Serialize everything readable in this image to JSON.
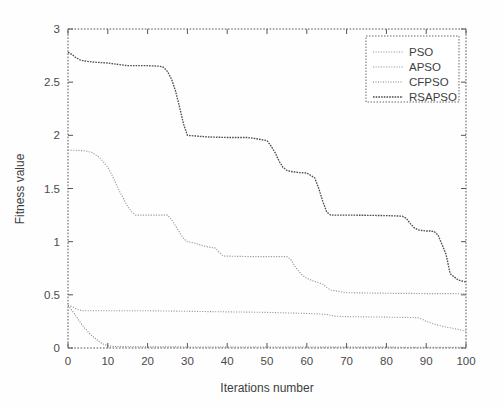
{
  "figure": {
    "background_color": "#fefefe",
    "axis_color": "#555555"
  },
  "chart_data": {
    "type": "line",
    "title": "",
    "subtitle": "",
    "xlabel": "Iterations number",
    "ylabel": "Fitness value",
    "xlim": [
      0,
      100
    ],
    "ylim": [
      0,
      3
    ],
    "xticks": [
      0,
      10,
      20,
      30,
      40,
      50,
      60,
      70,
      80,
      90,
      100
    ],
    "xticklabels": [
      "0",
      "10",
      "20",
      "30",
      "40",
      "50",
      "60",
      "70",
      "80",
      "90",
      "100"
    ],
    "yticks": [
      0,
      0.5,
      1,
      1.5,
      2,
      2.5,
      3
    ],
    "yticklabels": [
      "0",
      "0.5",
      "1",
      "1.5",
      "2",
      "2.5",
      "3"
    ],
    "grid": false,
    "legend_position": "upper right",
    "legend_entries": [
      "PSO",
      "APSO",
      "CFPSO",
      "RSAPSO"
    ],
    "series": [
      {
        "name": "PSO",
        "color": "#8d8d8d",
        "linestyle": "dotted",
        "x": [
          0,
          1,
          2,
          3,
          4,
          6,
          10,
          20,
          30,
          40,
          50,
          55,
          60,
          63,
          65,
          67,
          70,
          80,
          85,
          88,
          89,
          90,
          92,
          94,
          96,
          98,
          100
        ],
        "values": [
          0.4,
          0.39,
          0.37,
          0.355,
          0.35,
          0.35,
          0.35,
          0.35,
          0.345,
          0.34,
          0.335,
          0.33,
          0.325,
          0.32,
          0.315,
          0.3,
          0.295,
          0.29,
          0.288,
          0.285,
          0.27,
          0.25,
          0.225,
          0.205,
          0.19,
          0.175,
          0.16
        ]
      },
      {
        "name": "APSO",
        "color": "#9a9a9a",
        "linestyle": "dotted",
        "x": [
          0,
          2,
          4,
          6,
          8,
          10,
          11,
          12,
          13,
          14,
          15,
          16,
          17,
          20,
          23,
          25,
          26,
          27,
          28,
          29,
          30,
          32,
          34,
          36,
          37,
          38,
          39,
          45,
          50,
          55,
          56,
          57,
          58,
          59,
          60,
          61,
          62,
          63,
          64,
          65,
          66,
          70,
          80,
          90,
          100
        ],
        "values": [
          1.86,
          1.86,
          1.855,
          1.84,
          1.79,
          1.7,
          1.63,
          1.55,
          1.47,
          1.4,
          1.33,
          1.28,
          1.25,
          1.25,
          1.25,
          1.25,
          1.21,
          1.15,
          1.09,
          1.03,
          1.0,
          0.985,
          0.96,
          0.945,
          0.94,
          0.9,
          0.865,
          0.86,
          0.86,
          0.86,
          0.83,
          0.77,
          0.72,
          0.68,
          0.655,
          0.64,
          0.625,
          0.615,
          0.6,
          0.57,
          0.545,
          0.52,
          0.515,
          0.512,
          0.51
        ]
      },
      {
        "name": "CFPSO",
        "color": "#7e7e7e",
        "linestyle": "dotted",
        "x": [
          0,
          1,
          2,
          3,
          4,
          5,
          6,
          7,
          8,
          9,
          10,
          11,
          15,
          20,
          30,
          40,
          50,
          60,
          70,
          80,
          90,
          100
        ],
        "values": [
          0.4,
          0.355,
          0.3,
          0.245,
          0.195,
          0.155,
          0.115,
          0.085,
          0.055,
          0.035,
          0.022,
          0.015,
          0.012,
          0.011,
          0.01,
          0.01,
          0.009,
          0.009,
          0.008,
          0.008,
          0.007,
          0.007
        ]
      },
      {
        "name": "RSAPSO",
        "color": "#4d4d4d",
        "linestyle": "dashed",
        "x": [
          0,
          1,
          2,
          3,
          4,
          5,
          6,
          8,
          10,
          11,
          12,
          13,
          14,
          15,
          20,
          23,
          24,
          25,
          26,
          27,
          28,
          29,
          30,
          35,
          40,
          45,
          46,
          47,
          50,
          51,
          52,
          53,
          54,
          55,
          56,
          57,
          58,
          60,
          62,
          63,
          64,
          65,
          66,
          70,
          75,
          80,
          84,
          85,
          86,
          87,
          88,
          89,
          90,
          91,
          92,
          93,
          94,
          95,
          96,
          98,
          100
        ],
        "values": [
          2.78,
          2.76,
          2.73,
          2.71,
          2.7,
          2.695,
          2.69,
          2.685,
          2.68,
          2.675,
          2.67,
          2.665,
          2.66,
          2.655,
          2.655,
          2.65,
          2.64,
          2.6,
          2.53,
          2.42,
          2.27,
          2.11,
          2.0,
          1.985,
          1.98,
          1.98,
          1.975,
          1.97,
          1.95,
          1.9,
          1.84,
          1.76,
          1.7,
          1.67,
          1.66,
          1.655,
          1.65,
          1.645,
          1.6,
          1.5,
          1.38,
          1.28,
          1.25,
          1.25,
          1.248,
          1.245,
          1.24,
          1.22,
          1.17,
          1.13,
          1.11,
          1.105,
          1.1,
          1.1,
          1.095,
          1.06,
          0.97,
          0.88,
          0.7,
          0.64,
          0.62
        ]
      }
    ]
  }
}
